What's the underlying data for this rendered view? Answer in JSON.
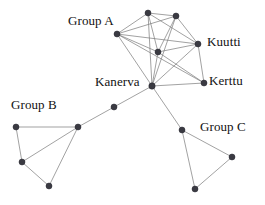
{
  "figure": {
    "type": "network-graph",
    "width": 265,
    "height": 205,
    "background_color": "#ffffff",
    "node_color": "#3a3a42",
    "edge_color": "#7a7a7a",
    "text_color": "#111111"
  },
  "labels": {
    "group_a": "Group A",
    "group_b": "Group B",
    "group_c": "Group C",
    "kanerva": "Kanerva",
    "kuutti": "Kuutti",
    "kerttu": "Kerttu"
  },
  "label_positions": {
    "group_a": {
      "x": 68,
      "y": 14
    },
    "group_b": {
      "x": 11,
      "y": 98
    },
    "group_c": {
      "x": 200,
      "y": 120
    },
    "kanerva": {
      "x": 95,
      "y": 75
    },
    "kuutti": {
      "x": 207,
      "y": 35
    },
    "kerttu": {
      "x": 209,
      "y": 74
    }
  },
  "nodes": [
    {
      "id": "a1",
      "group": "Group A",
      "x": 148,
      "y": 13,
      "r": 3.0
    },
    {
      "id": "a2",
      "group": "Group A",
      "x": 176,
      "y": 16,
      "r": 3.0
    },
    {
      "id": "a3",
      "group": "Group A",
      "x": 117,
      "y": 34,
      "r": 3.0
    },
    {
      "id": "a4",
      "group": "Group A",
      "x": 158,
      "y": 52,
      "r": 3.0
    },
    {
      "id": "kuutti",
      "group": "Group A",
      "x": 198,
      "y": 44,
      "r": 3.0
    },
    {
      "id": "kerttu",
      "group": "Group A",
      "x": 204,
      "y": 83,
      "r": 3.0
    },
    {
      "id": "kanerva",
      "group": "hub",
      "x": 152,
      "y": 86,
      "r": 3.2
    },
    {
      "id": "bridge",
      "group": "bridge",
      "x": 114,
      "y": 107,
      "r": 3.0
    },
    {
      "id": "b1",
      "group": "Group B",
      "x": 78,
      "y": 127,
      "r": 3.0
    },
    {
      "id": "b2",
      "group": "Group B",
      "x": 16,
      "y": 127,
      "r": 3.0
    },
    {
      "id": "b3",
      "group": "Group B",
      "x": 22,
      "y": 162,
      "r": 3.0
    },
    {
      "id": "b4",
      "group": "Group B",
      "x": 49,
      "y": 186,
      "r": 3.0
    },
    {
      "id": "c1",
      "group": "Group C",
      "x": 182,
      "y": 130,
      "r": 3.0
    },
    {
      "id": "c2",
      "group": "Group C",
      "x": 232,
      "y": 157,
      "r": 3.0
    },
    {
      "id": "c3",
      "group": "Group C",
      "x": 195,
      "y": 189,
      "r": 3.0
    }
  ],
  "edges": [
    {
      "source": "a1",
      "target": "a2"
    },
    {
      "source": "a1",
      "target": "a3"
    },
    {
      "source": "a1",
      "target": "a4"
    },
    {
      "source": "a1",
      "target": "kuutti"
    },
    {
      "source": "a1",
      "target": "kanerva"
    },
    {
      "source": "a2",
      "target": "a3"
    },
    {
      "source": "a2",
      "target": "a4"
    },
    {
      "source": "a2",
      "target": "kuutti"
    },
    {
      "source": "a2",
      "target": "kanerva"
    },
    {
      "source": "a3",
      "target": "a4"
    },
    {
      "source": "a3",
      "target": "kuutti"
    },
    {
      "source": "a3",
      "target": "kanerva"
    },
    {
      "source": "a3",
      "target": "kerttu"
    },
    {
      "source": "a4",
      "target": "kuutti"
    },
    {
      "source": "a4",
      "target": "kanerva"
    },
    {
      "source": "a4",
      "target": "kerttu"
    },
    {
      "source": "kuutti",
      "target": "kerttu"
    },
    {
      "source": "kuutti",
      "target": "kanerva"
    },
    {
      "source": "kerttu",
      "target": "kanerva"
    },
    {
      "source": "kanerva",
      "target": "bridge"
    },
    {
      "source": "kanerva",
      "target": "c1"
    },
    {
      "source": "bridge",
      "target": "b1"
    },
    {
      "source": "b1",
      "target": "b2"
    },
    {
      "source": "b1",
      "target": "b3"
    },
    {
      "source": "b1",
      "target": "b4"
    },
    {
      "source": "b2",
      "target": "b3"
    },
    {
      "source": "b3",
      "target": "b4"
    },
    {
      "source": "c1",
      "target": "c2"
    },
    {
      "source": "c1",
      "target": "c3"
    },
    {
      "source": "c2",
      "target": "c3"
    }
  ]
}
